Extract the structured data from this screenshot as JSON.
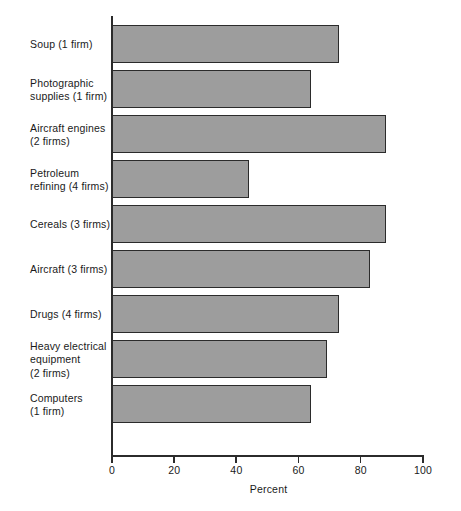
{
  "chart_data": {
    "type": "bar",
    "orientation": "horizontal",
    "title": "",
    "xlabel": "Percent",
    "ylabel": "",
    "xlim": [
      0,
      100
    ],
    "xticks": [
      0,
      20,
      40,
      60,
      80,
      100
    ],
    "xtick_labels": [
      "0",
      "20",
      "40",
      "60",
      "80",
      "100"
    ],
    "grid": false,
    "legend": null,
    "categories": [
      "Soup (1 firm)",
      "Photographic\nsupplies (1 firm)",
      "Aircraft engines\n(2 firms)",
      "Petroleum\nrefining (4 firms)",
      "Cereals (3 firms)",
      "Aircraft (3 firms)",
      "Drugs (4 firms)",
      "Heavy electrical\nequipment\n(2 firms)",
      "Computers\n(1 firm)"
    ],
    "values": [
      73,
      64,
      88,
      44,
      88,
      83,
      73,
      69,
      64
    ],
    "bar_fill_color": "#9d9d9d",
    "bar_border_color": "#2b2b2b",
    "axis_color": "#2b2b2b"
  }
}
